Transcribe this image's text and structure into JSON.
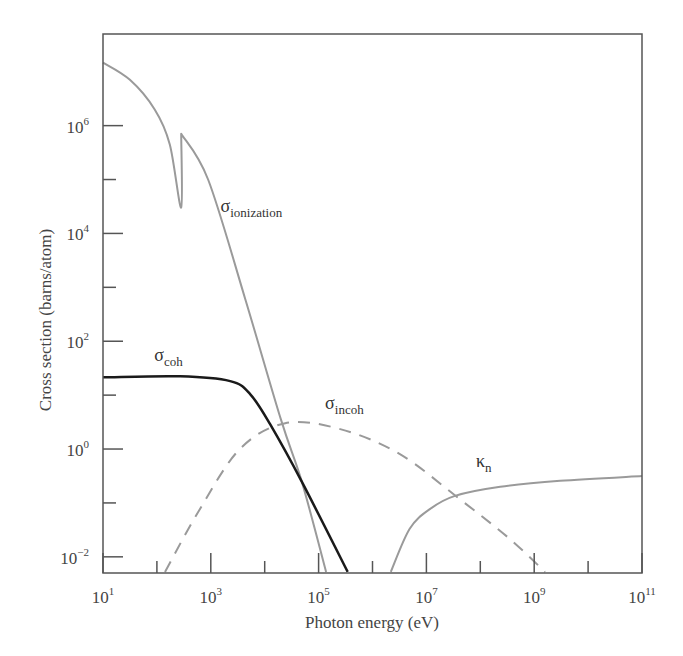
{
  "chart_data": {
    "type": "line",
    "title": "",
    "xlabel": "Photon energy (eV)",
    "ylabel": "Cross section (barns/atom)",
    "xscale": "log",
    "yscale": "log",
    "xlim_log10": [
      1,
      11
    ],
    "ylim_log10": [
      -2.3,
      7.7
    ],
    "grid": false,
    "legend": "none (inline curve labels)",
    "x_ticks": [
      {
        "exp": 1,
        "label": "10",
        "sup": "1"
      },
      {
        "exp": 3,
        "label": "10",
        "sup": "3"
      },
      {
        "exp": 5,
        "label": "10",
        "sup": "5"
      },
      {
        "exp": 7,
        "label": "10",
        "sup": "7"
      },
      {
        "exp": 9,
        "label": "10",
        "sup": "9"
      },
      {
        "exp": 11,
        "label": "10",
        "sup": "11"
      }
    ],
    "x_minor_ticks_log10": [
      2,
      4,
      6,
      8,
      10
    ],
    "y_ticks": [
      {
        "exp": -2,
        "label": "10",
        "sup": "−2"
      },
      {
        "exp": 0,
        "label": "10",
        "sup": "0"
      },
      {
        "exp": 2,
        "label": "10",
        "sup": "2"
      },
      {
        "exp": 4,
        "label": "10",
        "sup": "4"
      },
      {
        "exp": 6,
        "label": "10",
        "sup": "6"
      }
    ],
    "y_minor_ticks_log10": [
      -1,
      1,
      3,
      5
    ],
    "series": [
      {
        "name": "σ_ionization",
        "label_main": "σ",
        "label_sub": "ionization",
        "color": "#9a9a9a",
        "style": "solid",
        "width": 2,
        "label_pos_log10": [
          3.18,
          4.4
        ],
        "points_log10": [
          [
            1.0,
            7.17
          ],
          [
            1.5,
            6.85
          ],
          [
            1.96,
            6.3
          ],
          [
            2.24,
            5.65
          ],
          [
            2.45,
            4.48
          ],
          [
            2.45,
            5.85
          ],
          [
            2.95,
            5.0
          ],
          [
            3.64,
            2.78
          ],
          [
            4.3,
            0.55
          ],
          [
            4.69,
            -0.61
          ],
          [
            5.14,
            -2.28
          ]
        ]
      },
      {
        "name": "σ_coh",
        "label_main": "σ",
        "label_sub": "coh",
        "color": "#1a1a1a",
        "style": "solid",
        "width": 2.5,
        "label_pos_log10": [
          1.95,
          1.63
        ],
        "points_log10": [
          [
            1.0,
            1.33
          ],
          [
            2.43,
            1.35
          ],
          [
            3.36,
            1.26
          ],
          [
            3.73,
            1.02
          ],
          [
            4.1,
            0.46
          ],
          [
            4.69,
            -0.61
          ],
          [
            5.54,
            -2.28
          ]
        ]
      },
      {
        "name": "σ_incoh",
        "label_main": "σ",
        "label_sub": "incoh",
        "color": "#9a9a9a",
        "style": "dashed",
        "width": 2,
        "label_pos_log10": [
          5.12,
          0.74
        ],
        "points_log10": [
          [
            2.15,
            -2.28
          ],
          [
            2.8,
            -1.11
          ],
          [
            3.54,
            0.0
          ],
          [
            4.38,
            0.48
          ],
          [
            5.4,
            0.37
          ],
          [
            6.5,
            -0.09
          ],
          [
            7.62,
            -0.93
          ],
          [
            8.55,
            -1.67
          ],
          [
            9.2,
            -2.28
          ]
        ]
      },
      {
        "name": "κ_n",
        "label_main": "κ",
        "label_sub": "n",
        "color": "#9a9a9a",
        "style": "solid",
        "width": 2,
        "label_pos_log10": [
          7.92,
          -0.34
        ],
        "points_log10": [
          [
            6.34,
            -2.28
          ],
          [
            6.69,
            -1.48
          ],
          [
            7.07,
            -1.11
          ],
          [
            7.53,
            -0.87
          ],
          [
            8.37,
            -0.7
          ],
          [
            9.48,
            -0.59
          ],
          [
            11.0,
            -0.5
          ]
        ]
      }
    ]
  }
}
